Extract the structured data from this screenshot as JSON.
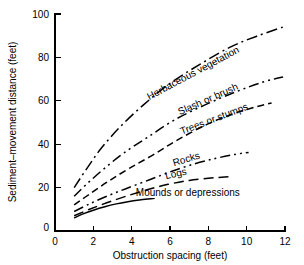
{
  "chart_data": {
    "type": "line",
    "title": "",
    "xlabel": "Obstruction spacing (feet)",
    "ylabel": "Sediment–movement distance (feet)",
    "xlim": [
      0,
      12
    ],
    "ylim": [
      0,
      100
    ],
    "xticks": [
      "0",
      "2",
      "4",
      "6",
      "8",
      "10",
      "12"
    ],
    "xtick_values": [
      0,
      2,
      4,
      6,
      8,
      10,
      12
    ],
    "yticks": [
      "0",
      "20",
      "40",
      "60",
      "80",
      "100"
    ],
    "ytick_values": [
      0,
      20,
      40,
      60,
      80,
      100
    ],
    "grid": false,
    "legend_position": "inline-labels",
    "series": [
      {
        "name": "Herbaceous vegetation",
        "label": "Herbaceous vegetation",
        "style": "dash-dot",
        "x": [
          1.0,
          1.6,
          2.4,
          3.4,
          4.6,
          6.0,
          7.6,
          9.2,
          10.6,
          11.9
        ],
        "y": [
          20.0,
          28.0,
          38.0,
          48.0,
          58.0,
          68.0,
          77.0,
          85.0,
          90.0,
          94.0
        ]
      },
      {
        "name": "Slash or brush",
        "label": "Slash or brush",
        "style": "dash-dot-dot",
        "x": [
          1.0,
          1.7,
          2.6,
          3.6,
          4.8,
          6.2,
          7.8,
          9.4,
          10.8,
          11.9
        ],
        "y": [
          16.0,
          22.0,
          29.0,
          36.0,
          43.0,
          51.0,
          58.0,
          64.0,
          68.5,
          71.0
        ]
      },
      {
        "name": "Trees or stumps",
        "label": "Trees or stumps",
        "style": "dash",
        "x": [
          1.0,
          1.8,
          2.8,
          3.9,
          5.1,
          6.4,
          7.9,
          9.3,
          10.4,
          11.3
        ],
        "y": [
          12.0,
          17.0,
          23.0,
          29.0,
          35.0,
          42.0,
          49.0,
          54.0,
          57.0,
          59.0
        ]
      },
      {
        "name": "Rocks",
        "label": "Rocks",
        "style": "dash-dot-dot",
        "x": [
          1.0,
          1.8,
          2.7,
          3.7,
          4.9,
          6.1,
          7.3,
          8.4,
          9.4,
          10.1
        ],
        "y": [
          9.0,
          12.5,
          16.0,
          19.5,
          23.5,
          27.5,
          31.0,
          33.5,
          35.3,
          36.2
        ]
      },
      {
        "name": "Logs",
        "label": "Logs",
        "style": "long-dash",
        "x": [
          1.0,
          1.8,
          2.7,
          3.7,
          4.8,
          5.9,
          7.0,
          8.0,
          8.7,
          9.2
        ],
        "y": [
          7.0,
          10.0,
          13.0,
          16.0,
          19.0,
          21.5,
          23.3,
          24.3,
          24.8,
          25.0
        ]
      },
      {
        "name": "Mounds or depressions",
        "label": "Mounds or depressions",
        "style": "solid",
        "x": [
          1.0,
          1.5,
          2.0,
          2.6,
          3.2,
          3.8,
          4.4,
          5.0,
          5.2
        ],
        "y": [
          6.0,
          8.0,
          9.6,
          11.2,
          12.5,
          13.5,
          14.3,
          14.9,
          15.1
        ]
      }
    ]
  },
  "axes": {
    "x_label": "Obstruction spacing (feet)",
    "y_label": "Sediment–movement distance (feet)"
  },
  "labels": {
    "herbaceous_vegetation": "Herbaceous vegetation",
    "slash_or_brush": "Slash or brush",
    "trees_or_stumps": "Trees or stumps",
    "rocks": "Rocks",
    "logs": "Logs",
    "mounds_or_depressions": "Mounds or depressions"
  },
  "colors": {
    "line": "#000000",
    "axis": "#000000",
    "background": "#ffffff"
  }
}
